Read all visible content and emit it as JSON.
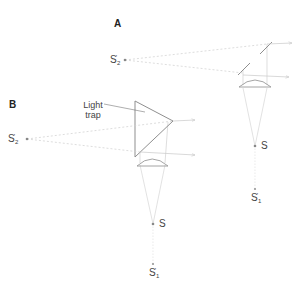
{
  "diagram": {
    "panel_a": {
      "label": "A",
      "source_point": {
        "name": "S",
        "x": 255,
        "y": 146
      },
      "image_point_1": {
        "name": "S",
        "prime": "'",
        "subscript": "1",
        "x": 255,
        "y": 189
      },
      "image_point_2": {
        "name": "S",
        "prime": "'",
        "subscript": "2",
        "x": 125,
        "y": 60
      },
      "components": [
        "two mirrors",
        "plano-convex lens"
      ]
    },
    "panel_b": {
      "label": "B",
      "source_point": {
        "name": "S",
        "x": 153,
        "y": 224
      },
      "image_point_1": {
        "name": "S",
        "prime": "'",
        "subscript": "1",
        "x": 153,
        "y": 264
      },
      "image_point_2": {
        "name": "S",
        "prime": "'",
        "subscript": "2",
        "x": 27,
        "y": 139
      },
      "trap_label_line1": "Light",
      "trap_label_line2": "trap",
      "components": [
        "prism light trap",
        "plano-convex lens"
      ]
    },
    "colors": {
      "line": "#9a9a9a",
      "ray": "#c8c8c8",
      "text": "#333333",
      "point": "#888888"
    }
  }
}
